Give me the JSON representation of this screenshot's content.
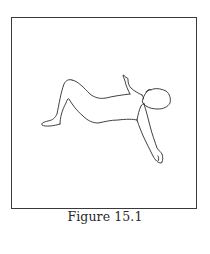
{
  "figure": {
    "caption": "Figure 15.1",
    "illustration": "line-drawing-person-lying-on-back-knees-bent-one-arm-raised",
    "border_color": "#3a3a3a",
    "line_color": "#2b2b2b"
  }
}
